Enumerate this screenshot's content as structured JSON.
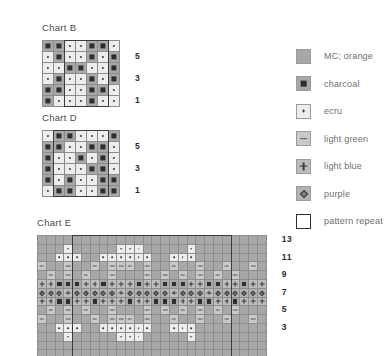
{
  "legend": {
    "items": [
      {
        "key": "mc",
        "symbol": "none",
        "label": "MC; orange",
        "color": "#a8a8a8"
      },
      {
        "key": "charcoal",
        "symbol": "square",
        "label": "charcoal",
        "color": "#a8a8a8"
      },
      {
        "key": "ecru",
        "symbol": "dot",
        "label": "ecru",
        "color": "#ededed"
      },
      {
        "key": "green",
        "symbol": "dash",
        "label": "light green",
        "color": "#c9c9c9"
      },
      {
        "key": "blue",
        "symbol": "plus",
        "label": "light blue",
        "color": "#bdbdbd"
      },
      {
        "key": "purple",
        "symbol": "diamond",
        "label": "purple",
        "color": "#b2b2b2"
      },
      {
        "key": "repeat",
        "symbol": "outline",
        "label": "pattern repeat",
        "color": "#ffffff"
      }
    ]
  },
  "charts": [
    {
      "id": "chart-b",
      "title": "Chart B",
      "cols": 7,
      "rows": 6,
      "cell": 11,
      "row_numbers": [
        "5",
        "3",
        "1"
      ],
      "row_number_rows": [
        1,
        3,
        5
      ],
      "repeat": {
        "start_col": 2,
        "end_col": 6,
        "start_row": 0,
        "end_row": 6
      },
      "cells": [
        [
          "charcoal",
          "charcoal",
          "ecru",
          "ecru",
          "charcoal",
          "charcoal",
          "ecru"
        ],
        [
          "ecru",
          "charcoal",
          "ecru",
          "ecru",
          "charcoal",
          "ecru",
          "charcoal"
        ],
        [
          "ecru",
          "ecru",
          "charcoal",
          "charcoal",
          "ecru",
          "ecru",
          "charcoal"
        ],
        [
          "ecru",
          "charcoal",
          "ecru",
          "ecru",
          "charcoal",
          "ecru",
          "charcoal"
        ],
        [
          "charcoal",
          "charcoal",
          "ecru",
          "ecru",
          "charcoal",
          "charcoal",
          "ecru"
        ],
        [
          "charcoal",
          "ecru",
          "ecru",
          "ecru",
          "charcoal",
          "ecru",
          "ecru"
        ]
      ]
    },
    {
      "id": "chart-d",
      "title": "Chart D",
      "cols": 7,
      "rows": 6,
      "cell": 11,
      "row_numbers": [
        "5",
        "3",
        "1"
      ],
      "row_number_rows": [
        1,
        3,
        5
      ],
      "repeat": {
        "start_col": 1,
        "end_col": 6,
        "start_row": 0,
        "end_row": 6
      },
      "cells": [
        [
          "ecru",
          "charcoal",
          "charcoal",
          "ecru",
          "ecru",
          "ecru",
          "charcoal"
        ],
        [
          "charcoal",
          "charcoal",
          "ecru",
          "ecru",
          "charcoal",
          "charcoal",
          "ecru"
        ],
        [
          "charcoal",
          "ecru",
          "ecru",
          "charcoal",
          "ecru",
          "charcoal",
          "ecru"
        ],
        [
          "charcoal",
          "ecru",
          "ecru",
          "ecru",
          "charcoal",
          "charcoal",
          "ecru"
        ],
        [
          "charcoal",
          "ecru",
          "charcoal",
          "ecru",
          "ecru",
          "charcoal",
          "charcoal"
        ],
        [
          "ecru",
          "charcoal",
          "charcoal",
          "ecru",
          "ecru",
          "charcoal",
          "charcoal"
        ]
      ]
    },
    {
      "id": "chart-e",
      "title": "Chart E",
      "cols": 26,
      "rows": 14,
      "cell": 8.8,
      "row_numbers": [
        "13",
        "11",
        "9",
        "7",
        "5",
        "3"
      ],
      "row_number_rows": [
        0,
        2,
        4,
        6,
        8,
        10
      ],
      "repeat": {
        "start_col": 4,
        "end_col": 22,
        "start_row": 0,
        "end_row": 14
      },
      "cells": [
        [
          "mc",
          "mc",
          "mc",
          "mc",
          "mc",
          "mc",
          "mc",
          "mc",
          "mc",
          "mc",
          "mc",
          "mc",
          "mc",
          "mc",
          "mc",
          "mc",
          "mc",
          "mc",
          "mc",
          "mc",
          "mc",
          "mc",
          "mc",
          "mc",
          "mc",
          "mc"
        ],
        [
          "mc",
          "mc",
          "mc",
          "ecru",
          "mc",
          "mc",
          "mc",
          "mc",
          "mc",
          "ecru",
          "ecru",
          "ecru",
          "mc",
          "mc",
          "mc",
          "mc",
          "mc",
          "ecru",
          "mc",
          "mc",
          "mc",
          "mc",
          "mc",
          "mc",
          "mc",
          "mc"
        ],
        [
          "mc",
          "mc",
          "ecru",
          "ecru",
          "ecru",
          "mc",
          "mc",
          "ecru",
          "ecru",
          "ecru",
          "ecru",
          "ecru",
          "ecru",
          "mc",
          "mc",
          "ecru",
          "ecru",
          "ecru",
          "mc",
          "mc",
          "mc",
          "mc",
          "mc",
          "mc",
          "mc",
          "mc"
        ],
        [
          "green",
          "mc",
          "mc",
          "green",
          "mc",
          "mc",
          "green",
          "mc",
          "green",
          "green",
          "green",
          "mc",
          "green",
          "mc",
          "mc",
          "green",
          "mc",
          "mc",
          "green",
          "mc",
          "mc",
          "green",
          "mc",
          "mc",
          "green",
          "mc"
        ],
        [
          "mc",
          "green",
          "mc",
          "green",
          "mc",
          "green",
          "mc",
          "mc",
          "green",
          "mc",
          "mc",
          "mc",
          "green",
          "mc",
          "green",
          "mc",
          "green",
          "mc",
          "green",
          "mc",
          "green",
          "mc",
          "green",
          "mc",
          "mc",
          "mc"
        ],
        [
          "blue",
          "blue",
          "charcoal",
          "charcoal",
          "charcoal",
          "blue",
          "blue",
          "charcoal",
          "blue",
          "blue",
          "blue",
          "charcoal",
          "blue",
          "blue",
          "charcoal",
          "charcoal",
          "charcoal",
          "blue",
          "blue",
          "charcoal",
          "charcoal",
          "blue",
          "blue",
          "charcoal",
          "blue",
          "blue"
        ],
        [
          "purple",
          "purple",
          "purple",
          "blue",
          "purple",
          "purple",
          "purple",
          "purple",
          "purple",
          "blue",
          "purple",
          "purple",
          "purple",
          "purple",
          "purple",
          "blue",
          "purple",
          "purple",
          "purple",
          "blue",
          "purple",
          "purple",
          "purple",
          "purple",
          "purple",
          "purple"
        ],
        [
          "blue",
          "blue",
          "charcoal",
          "charcoal",
          "blue",
          "blue",
          "charcoal",
          "blue",
          "blue",
          "blue",
          "charcoal",
          "blue",
          "blue",
          "charcoal",
          "charcoal",
          "charcoal",
          "blue",
          "blue",
          "charcoal",
          "charcoal",
          "blue",
          "blue",
          "charcoal",
          "blue",
          "blue",
          "blue"
        ],
        [
          "mc",
          "green",
          "mc",
          "green",
          "mc",
          "green",
          "mc",
          "mc",
          "green",
          "mc",
          "mc",
          "mc",
          "green",
          "mc",
          "green",
          "mc",
          "green",
          "mc",
          "green",
          "mc",
          "green",
          "mc",
          "green",
          "mc",
          "mc",
          "mc"
        ],
        [
          "green",
          "mc",
          "mc",
          "green",
          "mc",
          "mc",
          "green",
          "mc",
          "green",
          "green",
          "green",
          "mc",
          "green",
          "mc",
          "mc",
          "green",
          "mc",
          "mc",
          "green",
          "mc",
          "mc",
          "green",
          "mc",
          "mc",
          "green",
          "mc"
        ],
        [
          "mc",
          "mc",
          "ecru",
          "ecru",
          "ecru",
          "mc",
          "mc",
          "ecru",
          "ecru",
          "ecru",
          "ecru",
          "ecru",
          "ecru",
          "mc",
          "mc",
          "ecru",
          "ecru",
          "ecru",
          "mc",
          "mc",
          "mc",
          "mc",
          "mc",
          "mc",
          "mc",
          "mc"
        ],
        [
          "mc",
          "mc",
          "mc",
          "ecru",
          "mc",
          "mc",
          "mc",
          "mc",
          "mc",
          "ecru",
          "ecru",
          "ecru",
          "mc",
          "mc",
          "mc",
          "mc",
          "mc",
          "ecru",
          "mc",
          "mc",
          "mc",
          "mc",
          "mc",
          "mc",
          "mc",
          "mc"
        ],
        [
          "mc",
          "mc",
          "mc",
          "mc",
          "mc",
          "mc",
          "mc",
          "mc",
          "mc",
          "mc",
          "mc",
          "mc",
          "mc",
          "mc",
          "mc",
          "mc",
          "mc",
          "mc",
          "mc",
          "mc",
          "mc",
          "mc",
          "mc",
          "mc",
          "mc",
          "mc"
        ],
        [
          "mc",
          "mc",
          "mc",
          "mc",
          "mc",
          "mc",
          "mc",
          "mc",
          "mc",
          "mc",
          "mc",
          "mc",
          "mc",
          "mc",
          "mc",
          "mc",
          "mc",
          "mc",
          "mc",
          "mc",
          "mc",
          "mc",
          "mc",
          "mc",
          "mc",
          "mc"
        ]
      ]
    }
  ]
}
